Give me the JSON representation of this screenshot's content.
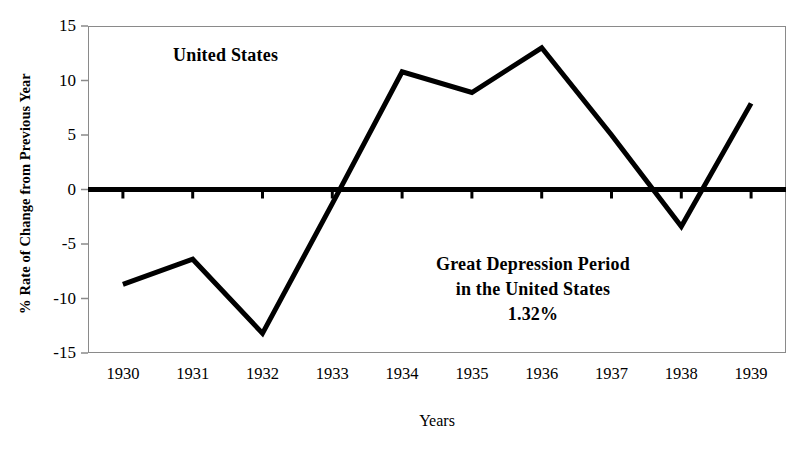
{
  "chart_data": {
    "type": "line",
    "title": "",
    "xlabel": "Years",
    "ylabel": "% Rate of Change from Previous Year",
    "categories": [
      "1930",
      "1931",
      "1932",
      "1933",
      "1934",
      "1935",
      "1936",
      "1937",
      "1938",
      "1939"
    ],
    "x": [
      1930,
      1931,
      1932,
      1933,
      1934,
      1935,
      1936,
      1937,
      1938,
      1939
    ],
    "values": [
      -8.7,
      -6.4,
      -13.2,
      -1.3,
      10.8,
      8.9,
      13.0,
      5.0,
      -3.4,
      7.9
    ],
    "series": [
      {
        "name": "United States",
        "values": [
          -8.7,
          -6.4,
          -13.2,
          -1.3,
          10.8,
          8.9,
          13.0,
          5.0,
          -3.4,
          7.9
        ]
      }
    ],
    "xlim": [
      1929.5,
      1939.5
    ],
    "ylim": [
      -15,
      15
    ],
    "yticks": [
      15,
      10,
      5,
      0,
      -5,
      -10,
      -15
    ],
    "ytick_labels": [
      "15",
      "10",
      "5",
      "0",
      "-5",
      "-10",
      "-15"
    ],
    "xtick_labels": [
      "1930",
      "1931",
      "1932",
      "1933",
      "1934",
      "1935",
      "1936",
      "1937",
      "1938",
      "1939"
    ],
    "grid": false,
    "legend": "none",
    "zero_line": 0,
    "line_color": "#000000",
    "frame_color": "#8a8a8a",
    "annotations": [
      {
        "name": "country-label",
        "text": "United States",
        "x": 1931.1,
        "y": 12.0
      },
      {
        "name": "depression-note",
        "lines": [
          "Great Depression Period",
          "in the United States",
          "1.32%"
        ],
        "x": 1935.6,
        "y": -7.0
      }
    ]
  },
  "axis": {
    "y_title": "% Rate of Change from Previous Year",
    "x_title": "Years"
  },
  "annotations": {
    "country": "United States",
    "depression_line1": "Great Depression Period",
    "depression_line2": "in the United States",
    "depression_line3": "1.32%"
  }
}
